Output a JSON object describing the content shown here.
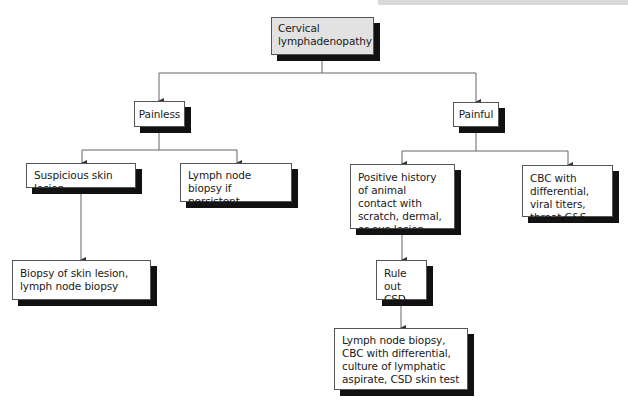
{
  "diagram": {
    "type": "flowchart",
    "title": "Cervical lymphadenopathy",
    "nodes": {
      "root": "Cervical lymphadenopathy",
      "painless": "Painless",
      "painful": "Painful",
      "suspicious_skin_lesion": "Suspicious skin lesion",
      "lymph_node_biopsy_if_persistent": "Lymph node biopsy if persistent",
      "biopsy_skin_lesion": "Biopsy of skin lesion, lymph node biopsy",
      "positive_history": "Positive history of animal contact with scratch, dermal, or eye lesion",
      "cbc_viral": "CBC with differential, viral titers, throat C&S",
      "rule_out_csd": "Rule out CSD",
      "final_workup": "Lymph node biopsy, CBC with differential, culture of lymphatic aspirate, CSD skin test"
    },
    "edges": [
      {
        "from": "root",
        "to": "painless"
      },
      {
        "from": "root",
        "to": "painful"
      },
      {
        "from": "painless",
        "to": "suspicious_skin_lesion"
      },
      {
        "from": "painless",
        "to": "lymph_node_biopsy_if_persistent"
      },
      {
        "from": "suspicious_skin_lesion",
        "to": "biopsy_skin_lesion"
      },
      {
        "from": "painful",
        "to": "positive_history"
      },
      {
        "from": "painful",
        "to": "cbc_viral"
      },
      {
        "from": "positive_history",
        "to": "rule_out_csd"
      },
      {
        "from": "rule_out_csd",
        "to": "final_workup"
      }
    ],
    "colors": {
      "root_fill": "#e2e2e2",
      "node_fill": "#ffffff",
      "shadow": "#111111",
      "line": "#555555"
    }
  }
}
